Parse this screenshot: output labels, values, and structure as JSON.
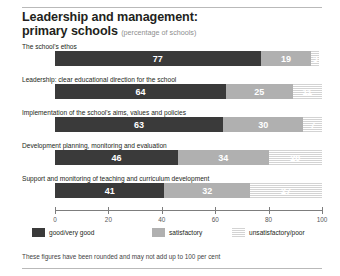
{
  "header": {
    "title_line1": "Leadership and management:",
    "title_line2": "primary schools",
    "subtitle": "(percentage of schools)"
  },
  "footnote": "These figures have been rounded and may not add up to 100 per cent",
  "colors": {
    "good": "#3a3a3a",
    "satisfactory": "#b0b0b0",
    "unsatisfactory": "#ececec",
    "axis": "#7d7d7d",
    "rule": "#b9b9b9",
    "text": "#231f20",
    "subtitle": "#8e8e8e"
  },
  "legend": {
    "items": [
      {
        "label": "good/very good",
        "key": "good"
      },
      {
        "label": "satisfactory",
        "key": "satis"
      },
      {
        "label": "unsatisfactory/poor",
        "key": "unsat"
      }
    ]
  },
  "chart_data": {
    "type": "bar",
    "orientation": "horizontal",
    "stacked": true,
    "title": "Leadership and management: primary schools (percentage of schools)",
    "xlabel": "",
    "ylabel": "",
    "xlim": [
      0,
      100
    ],
    "xticks": [
      0,
      20,
      40,
      60,
      80,
      100
    ],
    "xtick_labels": [
      "0",
      "20",
      "40",
      "60",
      "80",
      "100"
    ],
    "grid": false,
    "legend_position": "bottom",
    "categories": [
      "The school's ethos",
      "Leadership: clear educational direction for the school",
      "Implementation of the school's aims, values and policies",
      "Development planning, monitoring and evaluation",
      "Support and monitoring of teaching and curriculum development"
    ],
    "series": [
      {
        "name": "good/very good",
        "values": [
          77,
          64,
          63,
          46,
          41
        ]
      },
      {
        "name": "satisfactory",
        "values": [
          19,
          25,
          30,
          34,
          32
        ]
      },
      {
        "name": "unsatisfactory/poor",
        "values": [
          3,
          11,
          7,
          20,
          27
        ]
      }
    ],
    "rows": [
      {
        "label": "The school's ethos",
        "segments": [
          {
            "key": "good",
            "value": 77,
            "text": "77"
          },
          {
            "key": "satis",
            "value": 19,
            "text": "19"
          },
          {
            "key": "unsat",
            "value": 3,
            "text": "3"
          }
        ]
      },
      {
        "label": "Leadership: clear educational direction for the school",
        "segments": [
          {
            "key": "good",
            "value": 64,
            "text": "64"
          },
          {
            "key": "satis",
            "value": 25,
            "text": "25"
          },
          {
            "key": "unsat",
            "value": 11,
            "text": "11"
          }
        ]
      },
      {
        "label": "Implementation of the school's aims, values and policies",
        "segments": [
          {
            "key": "good",
            "value": 63,
            "text": "63"
          },
          {
            "key": "satis",
            "value": 30,
            "text": "30"
          },
          {
            "key": "unsat",
            "value": 7,
            "text": "7"
          }
        ]
      },
      {
        "label": "Development planning, monitoring and evaluation",
        "segments": [
          {
            "key": "good",
            "value": 46,
            "text": "46"
          },
          {
            "key": "satis",
            "value": 34,
            "text": "34"
          },
          {
            "key": "unsat",
            "value": 20,
            "text": "20"
          }
        ]
      },
      {
        "label": "Support and monitoring of teaching and curriculum development",
        "segments": [
          {
            "key": "good",
            "value": 41,
            "text": "41"
          },
          {
            "key": "satis",
            "value": 32,
            "text": "32"
          },
          {
            "key": "unsat",
            "value": 27,
            "text": "27"
          }
        ]
      }
    ]
  }
}
